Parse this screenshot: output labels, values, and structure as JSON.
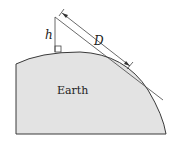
{
  "diagram": {
    "labels": {
      "height": "h",
      "distance": "D",
      "body": "Earth"
    },
    "colors": {
      "earth_fill": "#e3e3e3",
      "stroke": "#3a3a3a"
    }
  }
}
